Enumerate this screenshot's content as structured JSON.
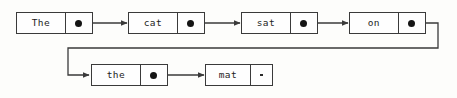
{
  "diagram": {
    "type": "linked-list",
    "sentence": "The cat sat on the mat",
    "colors": {
      "background": "#fdfdfb",
      "stroke": "#3a3a3a",
      "text": "#1d1d1d",
      "pointer_dot": "#141414"
    },
    "nodes": [
      {
        "id": "node-the-1",
        "value": "The",
        "index": 0,
        "row": "top",
        "pointer": "filled-dot",
        "pointer_target": "node-cat",
        "box": {
          "x": 16,
          "y": 12,
          "w": 77,
          "h": 22,
          "data_w": 50,
          "ptr_w": 27
        }
      },
      {
        "id": "node-cat",
        "value": "cat",
        "index": 1,
        "row": "top",
        "pointer": "filled-dot",
        "pointer_target": "node-sat",
        "box": {
          "x": 128,
          "y": 12,
          "w": 77,
          "h": 22,
          "data_w": 50,
          "ptr_w": 27
        }
      },
      {
        "id": "node-sat",
        "value": "sat",
        "index": 2,
        "row": "top",
        "pointer": "filled-dot",
        "pointer_target": "node-on",
        "box": {
          "x": 241,
          "y": 12,
          "w": 77,
          "h": 22,
          "data_w": 50,
          "ptr_w": 27
        }
      },
      {
        "id": "node-on",
        "value": "on",
        "index": 3,
        "row": "top",
        "pointer": "filled-dot",
        "pointer_target": "node-the-2",
        "box": {
          "x": 349,
          "y": 12,
          "w": 77,
          "h": 22,
          "data_w": 50,
          "ptr_w": 27
        }
      },
      {
        "id": "node-the-2",
        "value": "the",
        "index": 4,
        "row": "bottom",
        "pointer": "filled-dot",
        "pointer_target": "node-mat",
        "box": {
          "x": 91,
          "y": 64,
          "w": 77,
          "h": 22,
          "data_w": 50,
          "ptr_w": 27
        }
      },
      {
        "id": "node-mat",
        "value": "mat",
        "index": 5,
        "row": "bottom",
        "pointer": "null-marker",
        "pointer_target": null,
        "box": {
          "x": 205,
          "y": 64,
          "w": 68,
          "h": 22,
          "data_w": 46,
          "ptr_w": 22
        }
      }
    ],
    "links": [
      {
        "id": "link-the1-cat",
        "from": "node-the-1",
        "to": "node-cat",
        "shape": "straight",
        "arrow": true
      },
      {
        "id": "link-cat-sat",
        "from": "node-cat",
        "to": "node-sat",
        "shape": "straight",
        "arrow": true
      },
      {
        "id": "link-sat-on",
        "from": "node-sat",
        "to": "node-on",
        "shape": "straight",
        "arrow": true
      },
      {
        "id": "link-on-the2",
        "from": "node-on",
        "to": "node-the-2",
        "shape": "wrap-around",
        "arrow": true
      },
      {
        "id": "link-the2-mat",
        "from": "node-the-2",
        "to": "node-mat",
        "shape": "straight",
        "arrow": true
      }
    ]
  }
}
